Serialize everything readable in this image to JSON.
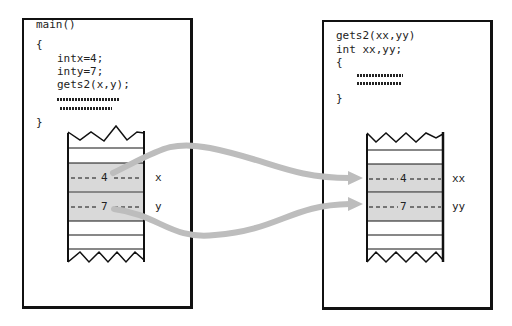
{
  "caller": {
    "lines": [
      "main()",
      "{",
      "intx=4;",
      "inty=7;",
      "gets2(x,y);",
      "}"
    ],
    "stack": {
      "values": [
        "4",
        "7"
      ],
      "labels": [
        "x",
        "y"
      ]
    }
  },
  "callee": {
    "lines": [
      "gets2(xx,yy)",
      "int xx,yy;",
      "{",
      "}"
    ],
    "stack": {
      "values": [
        "4",
        "7"
      ],
      "labels": [
        "xx",
        "yy"
      ]
    }
  },
  "colors": {
    "arrow": "#bdbdbd",
    "cell_fill": "#d9d9d9",
    "line": "#111111"
  }
}
